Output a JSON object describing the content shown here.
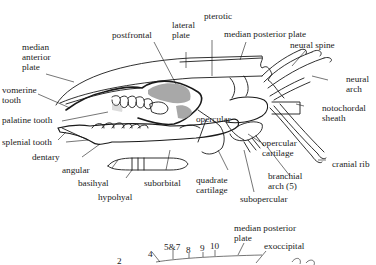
{
  "figure": {
    "upper_diagram": {
      "title": "Lateral view of skull",
      "labels": {
        "median_anterior_plate": [
          "median",
          "anterior",
          "plate"
        ],
        "vomerine_tooth": [
          "vomerine",
          "tooth"
        ],
        "palatine_tooth": "palatine tooth",
        "splenial_tooth": "splenial tooth",
        "dentary": "dentary",
        "angular": "angular",
        "basihyal": "basihyal",
        "hypohyal": "hypohyal",
        "suborbital": "suborbital",
        "postfrontal": "postfrontal",
        "lateral_plate": [
          "lateral",
          "plate"
        ],
        "pterotic": "pterotic",
        "median_posterior_plate": "median posterior plate",
        "neural_spine": "neural spine",
        "neural_arch": [
          "neural",
          "arch"
        ],
        "notochordal_sheath": [
          "notochordal",
          "sheath"
        ],
        "opercular": "opercular",
        "opercular_cartilage": [
          "opercular",
          "cartilage"
        ],
        "cranial_rib": "cranial rib",
        "branchial_arch": [
          "branchial",
          "arch (5)"
        ],
        "quadrate_cartilage": [
          "quadrate",
          "cartilage"
        ],
        "subopercular": "subopercular"
      }
    },
    "lower_diagram": {
      "labels": {
        "n2": "2",
        "n4": "4",
        "n5_7": "5&7",
        "n8": "8",
        "n9": "9",
        "n10": "10",
        "median_posterior_plate": [
          "median posterior",
          "plate"
        ],
        "exoccipital": "exoccipital"
      }
    }
  },
  "colors": {
    "ink": "#1a1a1a",
    "shade": "#9a9a9a",
    "paper": "#ffffff"
  }
}
